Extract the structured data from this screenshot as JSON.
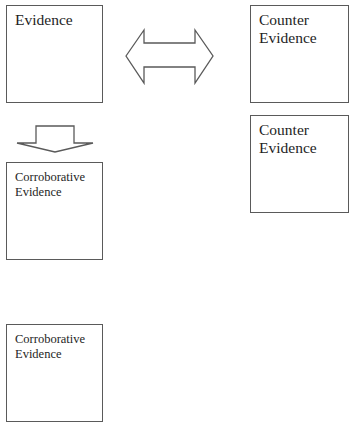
{
  "diagram": {
    "nodes": [
      {
        "id": "evidence",
        "label": "Evidence"
      },
      {
        "id": "counter_evidence_1",
        "label": "Counter\nEvidence"
      },
      {
        "id": "counter_evidence_2",
        "label": "Counter\nEvidence"
      },
      {
        "id": "corroborative_evidence_1",
        "label": "Corroborative\nEvidence"
      },
      {
        "id": "corroborative_evidence_2",
        "label": "Corroborative\nEvidence"
      }
    ],
    "edges": [
      {
        "from": "evidence",
        "to": "counter_evidence_1",
        "type": "bidirectional-block-arrow"
      },
      {
        "from": "evidence",
        "to": "corroborative_evidence_1",
        "type": "down-block-arrow"
      }
    ],
    "colors": {
      "border": "#5a5a5a",
      "text": "#1e1e1e",
      "background": "#ffffff"
    }
  }
}
